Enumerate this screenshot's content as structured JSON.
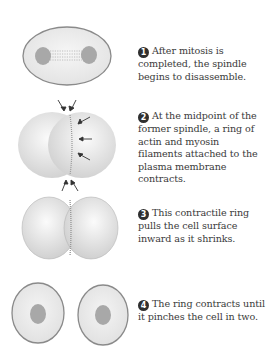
{
  "diagram": {
    "steps": [
      {
        "number": "1",
        "text": "After mitosis is completed, the spindle begins to disassemble.",
        "figure": "single-oval-cell-with-spindle-between-two-nuclei"
      },
      {
        "number": "2",
        "text": "At the midpoint of the former spindle, a ring of actin and myosin filaments attached to the plasma membrane contracts.",
        "figure": "cell-with-contractile-ring-and-inward-arrows"
      },
      {
        "number": "3",
        "text": "This contractile ring pulls the cell surface inward as it shrinks.",
        "figure": "cell-pinching-with-deep-furrow"
      },
      {
        "number": "4",
        "text": "The ring contracts until it pinches the cell in two.",
        "figure": "two-separate-daughter-cells-with-nuclei"
      }
    ]
  },
  "colors": {
    "cell_fill": "#eeeeee",
    "cell_outline": "#8a8a8a",
    "nucleus": "#a8a8a8",
    "badge": "#2f2f2f",
    "text": "#3a3a3a"
  }
}
